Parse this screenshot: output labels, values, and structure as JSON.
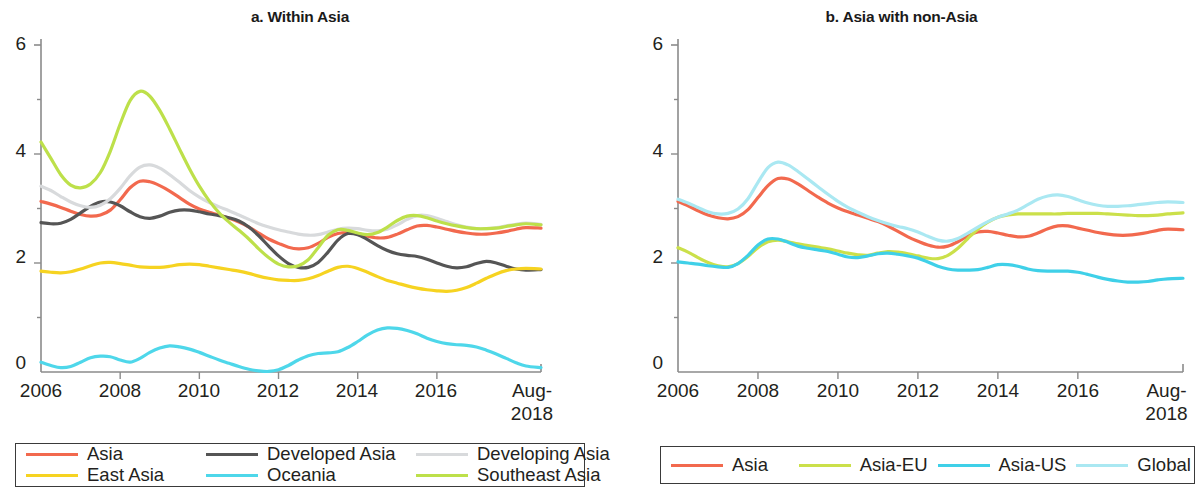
{
  "figure": {
    "panels": [
      {
        "id": "a",
        "title": "a. Within Asia",
        "y_axis": {
          "ticks": [
            "6",
            "4",
            "2",
            "0"
          ],
          "min": 0,
          "max": 6
        },
        "x_axis": {
          "ticks": [
            "2006",
            "2008",
            "2010",
            "2012",
            "2014",
            "2016",
            "Aug-\n2018"
          ]
        }
      },
      {
        "id": "b",
        "title": "b. Asia with non-Asia",
        "y_axis": {
          "ticks": [
            "6",
            "4",
            "2",
            "0"
          ],
          "min": 0,
          "max": 6
        },
        "x_axis": {
          "ticks": [
            "2006",
            "2008",
            "2010",
            "2012",
            "2014",
            "2016",
            "Aug-\n2018"
          ]
        }
      }
    ],
    "x_tick_labels": {
      "t2006": "2006",
      "t2008": "2008",
      "t2010": "2010",
      "t2012": "2012",
      "t2014": "2014",
      "t2016": "2016",
      "tend_line1": "Aug-",
      "tend_line2": "2018"
    },
    "y_tick_labels": {
      "t6": "6",
      "t4": "4",
      "t2": "2",
      "t0": "0"
    },
    "legend_a": [
      {
        "label": "Asia",
        "color": "#f2694e"
      },
      {
        "label": "Developed Asia",
        "color": "#555555"
      },
      {
        "label": "Developing Asia",
        "color": "#d8dadc"
      },
      {
        "label": "East Asia",
        "color": "#f6d321"
      },
      {
        "label": "Oceania",
        "color": "#4ed7ea"
      },
      {
        "label": "Southeast Asia",
        "color": "#bde04a"
      }
    ],
    "legend_b": [
      {
        "label": "Asia",
        "color": "#f2694e"
      },
      {
        "label": "Asia-EU",
        "color": "#cbe04a"
      },
      {
        "label": "Asia-US",
        "color": "#3fd0e8"
      },
      {
        "label": "Global",
        "color": "#aae8f2"
      }
    ]
  },
  "chart_data": [
    {
      "type": "line",
      "title": "a. Within Asia",
      "xlabel": "",
      "ylabel": "",
      "ylim": [
        0,
        6
      ],
      "xlim": [
        2006,
        2018.63
      ],
      "grid": false,
      "legend_position": "below",
      "x_tick_values": [
        2006,
        2008,
        2010,
        2012,
        2014,
        2016,
        2018.63
      ],
      "x_tick_labels": [
        "2006",
        "2008",
        "2010",
        "2012",
        "2014",
        "2016",
        "Aug-2018"
      ],
      "y_tick_values": [
        0,
        2,
        4,
        6
      ],
      "x": [
        2006.0,
        2006.25,
        2006.5,
        2006.75,
        2007.0,
        2007.25,
        2007.5,
        2007.75,
        2008.0,
        2008.25,
        2008.5,
        2008.75,
        2009.0,
        2009.25,
        2009.5,
        2009.75,
        2010.0,
        2010.25,
        2010.5,
        2010.75,
        2011.0,
        2011.25,
        2011.5,
        2011.75,
        2012.0,
        2012.25,
        2012.5,
        2012.75,
        2013.0,
        2013.25,
        2013.5,
        2013.75,
        2014.0,
        2014.25,
        2014.5,
        2014.75,
        2015.0,
        2015.25,
        2015.5,
        2015.75,
        2016.0,
        2016.25,
        2016.5,
        2016.75,
        2017.0,
        2017.25,
        2017.5,
        2017.75,
        2018.0,
        2018.25,
        2018.63
      ],
      "series": [
        {
          "name": "Asia",
          "color": "#f2694e",
          "values": [
            3.13,
            3.08,
            3.02,
            2.95,
            2.89,
            2.86,
            2.88,
            2.97,
            3.16,
            3.38,
            3.5,
            3.49,
            3.42,
            3.32,
            3.2,
            3.08,
            2.99,
            2.93,
            2.88,
            2.82,
            2.75,
            2.66,
            2.55,
            2.44,
            2.36,
            2.29,
            2.26,
            2.28,
            2.36,
            2.47,
            2.54,
            2.56,
            2.54,
            2.49,
            2.46,
            2.47,
            2.53,
            2.61,
            2.68,
            2.69,
            2.66,
            2.62,
            2.58,
            2.55,
            2.53,
            2.53,
            2.55,
            2.58,
            2.62,
            2.65,
            2.64
          ]
        },
        {
          "name": "Developed Asia",
          "color": "#555555",
          "values": [
            2.74,
            2.72,
            2.73,
            2.8,
            2.92,
            3.04,
            3.12,
            3.12,
            3.05,
            2.94,
            2.85,
            2.82,
            2.86,
            2.93,
            2.97,
            2.97,
            2.94,
            2.9,
            2.87,
            2.83,
            2.77,
            2.66,
            2.5,
            2.31,
            2.13,
            1.99,
            1.92,
            1.92,
            2.01,
            2.2,
            2.42,
            2.54,
            2.52,
            2.43,
            2.32,
            2.23,
            2.17,
            2.14,
            2.12,
            2.07,
            2.0,
            1.94,
            1.91,
            1.93,
            1.99,
            2.03,
            2.0,
            1.94,
            1.89,
            1.87,
            1.88
          ]
        },
        {
          "name": "Developing Asia",
          "color": "#d8dadc",
          "values": [
            3.41,
            3.33,
            3.22,
            3.12,
            3.05,
            3.02,
            3.06,
            3.18,
            3.37,
            3.6,
            3.76,
            3.8,
            3.74,
            3.62,
            3.48,
            3.33,
            3.21,
            3.11,
            3.03,
            2.96,
            2.88,
            2.8,
            2.72,
            2.66,
            2.61,
            2.57,
            2.53,
            2.51,
            2.52,
            2.57,
            2.62,
            2.64,
            2.63,
            2.6,
            2.59,
            2.62,
            2.7,
            2.8,
            2.87,
            2.87,
            2.82,
            2.76,
            2.7,
            2.66,
            2.63,
            2.63,
            2.65,
            2.68,
            2.71,
            2.73,
            2.71
          ]
        },
        {
          "name": "East Asia",
          "color": "#f6d321",
          "values": [
            1.85,
            1.83,
            1.82,
            1.84,
            1.89,
            1.95,
            2.0,
            2.01,
            1.99,
            1.96,
            1.93,
            1.92,
            1.92,
            1.94,
            1.97,
            1.98,
            1.97,
            1.94,
            1.91,
            1.88,
            1.85,
            1.81,
            1.76,
            1.72,
            1.69,
            1.68,
            1.68,
            1.71,
            1.77,
            1.85,
            1.92,
            1.94,
            1.9,
            1.83,
            1.75,
            1.68,
            1.63,
            1.58,
            1.54,
            1.51,
            1.49,
            1.48,
            1.5,
            1.55,
            1.63,
            1.72,
            1.8,
            1.86,
            1.89,
            1.9,
            1.89
          ]
        },
        {
          "name": "Oceania",
          "color": "#4ed7ea",
          "values": [
            0.18,
            0.12,
            0.08,
            0.1,
            0.18,
            0.26,
            0.29,
            0.28,
            0.22,
            0.18,
            0.25,
            0.36,
            0.44,
            0.48,
            0.46,
            0.42,
            0.36,
            0.29,
            0.22,
            0.16,
            0.1,
            0.05,
            0.02,
            0.01,
            0.04,
            0.12,
            0.22,
            0.3,
            0.34,
            0.35,
            0.37,
            0.45,
            0.56,
            0.68,
            0.77,
            0.81,
            0.8,
            0.76,
            0.7,
            0.62,
            0.56,
            0.52,
            0.5,
            0.49,
            0.46,
            0.4,
            0.33,
            0.25,
            0.17,
            0.11,
            0.08
          ]
        },
        {
          "name": "Southeast Asia",
          "color": "#bde04a",
          "values": [
            4.22,
            3.92,
            3.62,
            3.43,
            3.38,
            3.45,
            3.66,
            4.05,
            4.55,
            4.98,
            5.15,
            5.06,
            4.8,
            4.46,
            4.09,
            3.73,
            3.41,
            3.14,
            2.92,
            2.75,
            2.6,
            2.44,
            2.26,
            2.1,
            1.98,
            1.93,
            1.95,
            2.06,
            2.28,
            2.51,
            2.61,
            2.6,
            2.55,
            2.52,
            2.56,
            2.66,
            2.78,
            2.86,
            2.87,
            2.83,
            2.77,
            2.72,
            2.68,
            2.65,
            2.63,
            2.63,
            2.64,
            2.67,
            2.7,
            2.72,
            2.7
          ]
        }
      ]
    },
    {
      "type": "line",
      "title": "b. Asia with non-Asia",
      "xlabel": "",
      "ylabel": "",
      "ylim": [
        0,
        6
      ],
      "xlim": [
        2006,
        2018.63
      ],
      "grid": false,
      "legend_position": "below",
      "x_tick_values": [
        2006,
        2008,
        2010,
        2012,
        2014,
        2016,
        2018.63
      ],
      "x_tick_labels": [
        "2006",
        "2008",
        "2010",
        "2012",
        "2014",
        "2016",
        "Aug-2018"
      ],
      "y_tick_values": [
        0,
        2,
        4,
        6
      ],
      "x": [
        2006.0,
        2006.25,
        2006.5,
        2006.75,
        2007.0,
        2007.25,
        2007.5,
        2007.75,
        2008.0,
        2008.25,
        2008.5,
        2008.75,
        2009.0,
        2009.25,
        2009.5,
        2009.75,
        2010.0,
        2010.25,
        2010.5,
        2010.75,
        2011.0,
        2011.25,
        2011.5,
        2011.75,
        2012.0,
        2012.25,
        2012.5,
        2012.75,
        2013.0,
        2013.25,
        2013.5,
        2013.75,
        2014.0,
        2014.25,
        2014.5,
        2014.75,
        2015.0,
        2015.25,
        2015.5,
        2015.75,
        2016.0,
        2016.25,
        2016.5,
        2016.75,
        2017.0,
        2017.25,
        2017.5,
        2017.75,
        2018.0,
        2018.25,
        2018.63
      ],
      "series": [
        {
          "name": "Asia",
          "color": "#f2694e",
          "values": [
            3.13,
            3.05,
            2.96,
            2.88,
            2.83,
            2.81,
            2.85,
            2.98,
            3.2,
            3.42,
            3.55,
            3.54,
            3.45,
            3.33,
            3.21,
            3.1,
            3.01,
            2.94,
            2.88,
            2.82,
            2.76,
            2.68,
            2.58,
            2.48,
            2.4,
            2.33,
            2.29,
            2.31,
            2.39,
            2.5,
            2.57,
            2.58,
            2.55,
            2.51,
            2.48,
            2.49,
            2.55,
            2.63,
            2.68,
            2.68,
            2.64,
            2.6,
            2.56,
            2.53,
            2.51,
            2.51,
            2.53,
            2.56,
            2.6,
            2.62,
            2.61
          ]
        },
        {
          "name": "Asia-EU",
          "color": "#cbe04a",
          "values": [
            2.28,
            2.2,
            2.1,
            2.01,
            1.95,
            1.93,
            1.99,
            2.12,
            2.28,
            2.39,
            2.42,
            2.39,
            2.35,
            2.32,
            2.29,
            2.26,
            2.22,
            2.18,
            2.15,
            2.14,
            2.18,
            2.21,
            2.2,
            2.17,
            2.13,
            2.09,
            2.08,
            2.14,
            2.27,
            2.45,
            2.62,
            2.75,
            2.84,
            2.88,
            2.9,
            2.9,
            2.9,
            2.9,
            2.9,
            2.91,
            2.91,
            2.91,
            2.91,
            2.9,
            2.89,
            2.88,
            2.87,
            2.87,
            2.88,
            2.9,
            2.92
          ]
        },
        {
          "name": "Asia-US",
          "color": "#3fd0e8",
          "values": [
            2.02,
            2.0,
            1.98,
            1.95,
            1.93,
            1.92,
            1.99,
            2.14,
            2.33,
            2.44,
            2.44,
            2.38,
            2.31,
            2.27,
            2.24,
            2.21,
            2.16,
            2.11,
            2.1,
            2.13,
            2.17,
            2.18,
            2.16,
            2.13,
            2.09,
            2.02,
            1.94,
            1.89,
            1.87,
            1.87,
            1.88,
            1.92,
            1.97,
            1.97,
            1.94,
            1.89,
            1.86,
            1.85,
            1.85,
            1.85,
            1.83,
            1.79,
            1.74,
            1.7,
            1.67,
            1.65,
            1.65,
            1.66,
            1.69,
            1.71,
            1.72
          ]
        },
        {
          "name": "Global",
          "color": "#aae8f2",
          "values": [
            3.17,
            3.1,
            3.02,
            2.94,
            2.9,
            2.91,
            2.99,
            3.18,
            3.48,
            3.75,
            3.85,
            3.8,
            3.68,
            3.54,
            3.4,
            3.26,
            3.13,
            3.02,
            2.93,
            2.85,
            2.78,
            2.72,
            2.67,
            2.63,
            2.57,
            2.49,
            2.42,
            2.4,
            2.45,
            2.55,
            2.66,
            2.76,
            2.84,
            2.9,
            2.97,
            3.07,
            3.17,
            3.23,
            3.25,
            3.22,
            3.16,
            3.1,
            3.06,
            3.04,
            3.04,
            3.05,
            3.07,
            3.09,
            3.11,
            3.12,
            3.11
          ]
        }
      ]
    }
  ]
}
